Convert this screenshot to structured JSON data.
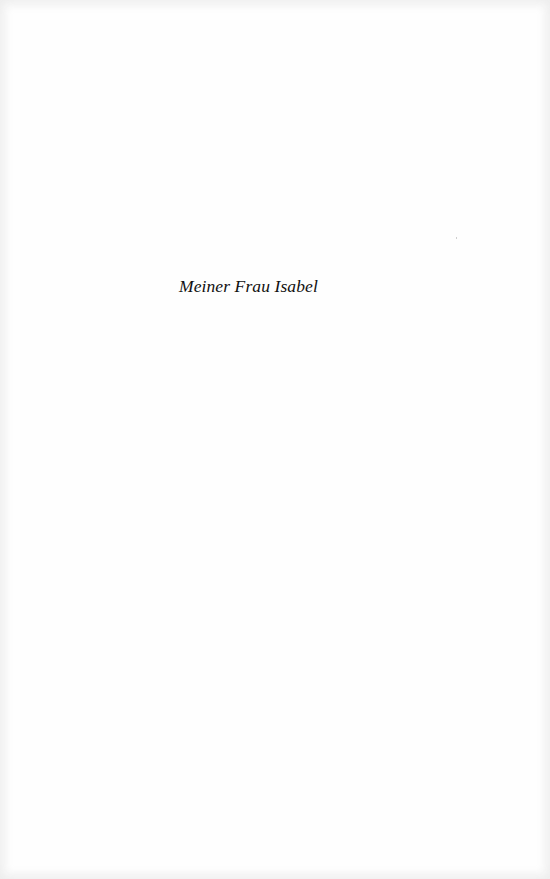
{
  "page": {
    "type": "dedication",
    "background_color": "#fefefe",
    "text_color": "#111111"
  },
  "dedication": {
    "text": "Meiner Frau Isabel"
  }
}
